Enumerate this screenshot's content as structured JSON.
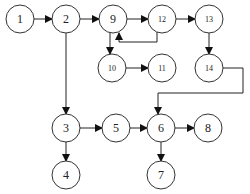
{
  "diagram": {
    "type": "flow-graph",
    "nodes": [
      {
        "id": "1",
        "label": "1",
        "x": 20,
        "y": 19
      },
      {
        "id": "2",
        "label": "2",
        "x": 66,
        "y": 19
      },
      {
        "id": "9",
        "label": "9",
        "x": 113,
        "y": 19
      },
      {
        "id": "12",
        "label": "12",
        "x": 162,
        "y": 19
      },
      {
        "id": "13",
        "label": "13",
        "x": 209,
        "y": 19
      },
      {
        "id": "10",
        "label": "10",
        "x": 112,
        "y": 68
      },
      {
        "id": "11",
        "label": "11",
        "x": 162,
        "y": 68
      },
      {
        "id": "14",
        "label": "14",
        "x": 209,
        "y": 68
      },
      {
        "id": "3",
        "label": "3",
        "x": 66,
        "y": 128
      },
      {
        "id": "5",
        "label": "5",
        "x": 116,
        "y": 128
      },
      {
        "id": "6",
        "label": "6",
        "x": 161,
        "y": 128
      },
      {
        "id": "8",
        "label": "8",
        "x": 208,
        "y": 128
      },
      {
        "id": "4",
        "label": "4",
        "x": 66,
        "y": 175
      },
      {
        "id": "7",
        "label": "7",
        "x": 161,
        "y": 175
      }
    ],
    "edges": [
      {
        "from": "1",
        "to": "2"
      },
      {
        "from": "2",
        "to": "9"
      },
      {
        "from": "9",
        "to": "12"
      },
      {
        "from": "12",
        "to": "9"
      },
      {
        "from": "12",
        "to": "13"
      },
      {
        "from": "9",
        "to": "10"
      },
      {
        "from": "10",
        "to": "11"
      },
      {
        "from": "13",
        "to": "14"
      },
      {
        "from": "14",
        "to": "6"
      },
      {
        "from": "2",
        "to": "3"
      },
      {
        "from": "3",
        "to": "5"
      },
      {
        "from": "3",
        "to": "4"
      },
      {
        "from": "5",
        "to": "6"
      },
      {
        "from": "6",
        "to": "8"
      },
      {
        "from": "6",
        "to": "7"
      }
    ]
  }
}
